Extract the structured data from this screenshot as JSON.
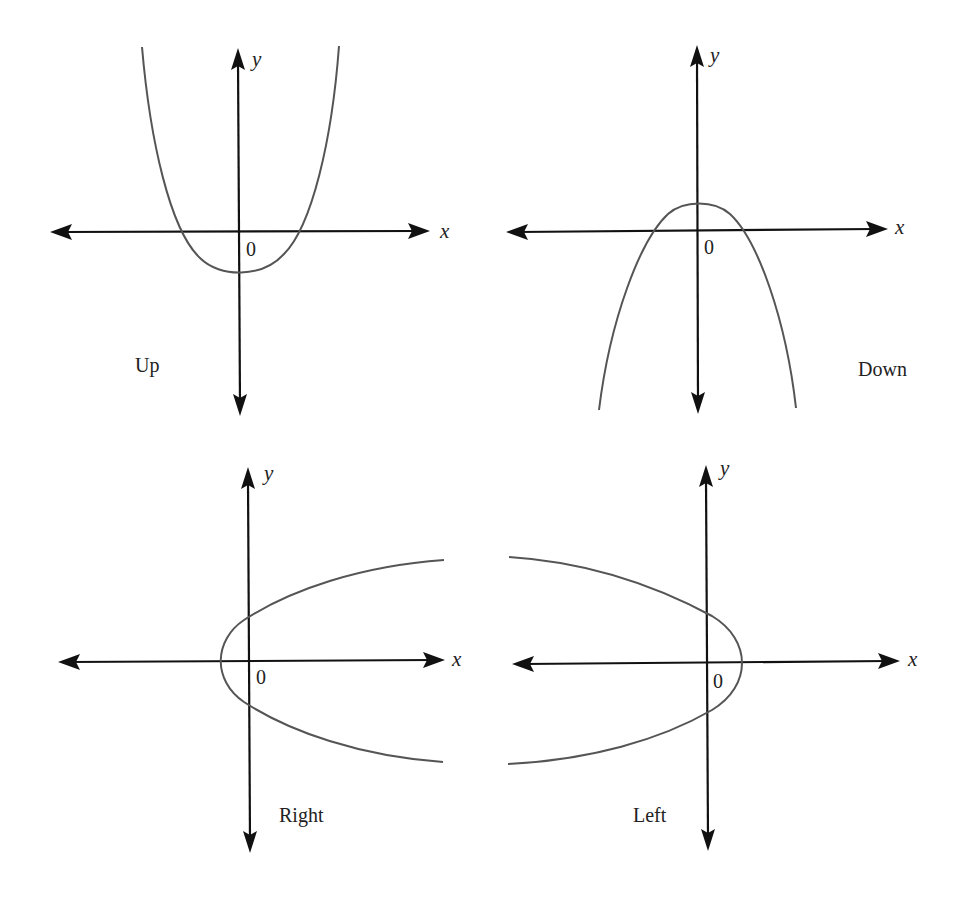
{
  "figure": {
    "panels": [
      {
        "id": "up",
        "label": "Up",
        "x_axis_label": "x",
        "y_axis_label": "y",
        "origin_label": "0",
        "opening": "up"
      },
      {
        "id": "down",
        "label": "Down",
        "x_axis_label": "x",
        "y_axis_label": "y",
        "origin_label": "0",
        "opening": "down"
      },
      {
        "id": "right",
        "label": "Right",
        "x_axis_label": "x",
        "y_axis_label": "y",
        "origin_label": "0",
        "opening": "right"
      },
      {
        "id": "left",
        "label": "Left",
        "x_axis_label": "x",
        "y_axis_label": "y",
        "origin_label": "0",
        "opening": "left"
      }
    ]
  },
  "colors": {
    "axis": "#111111",
    "curve": "#555555",
    "text": "#222222",
    "background": "#ffffff"
  }
}
